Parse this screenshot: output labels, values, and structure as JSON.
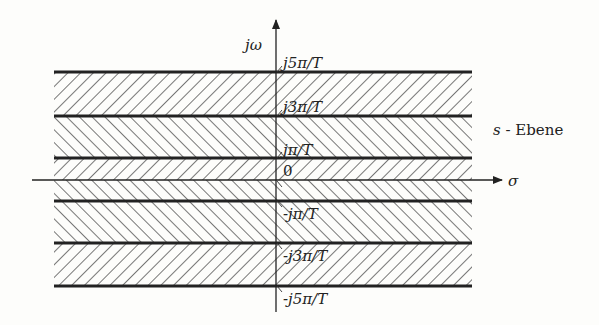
{
  "diagram": {
    "axes": {
      "vertical_label": "jω",
      "horizontal_label": "σ"
    },
    "plane_label": {
      "var": "s",
      "text": " - Ebene"
    },
    "tick_labels": [
      {
        "id": "p5",
        "text": "j5π/T"
      },
      {
        "id": "p3",
        "text": "j3π/T"
      },
      {
        "id": "p1",
        "text": "jπ/T"
      },
      {
        "id": "zero",
        "text": "0"
      },
      {
        "id": "m1",
        "text": "-jπ/T"
      },
      {
        "id": "m3",
        "text": "-j3π/T"
      },
      {
        "id": "m5",
        "text": "-j5π/T"
      }
    ],
    "strips": [
      {
        "from": "j5π/T",
        "to": "j3π/T",
        "hatch": "backslash"
      },
      {
        "from": "j3π/T",
        "to": "jπ/T",
        "hatch": "slash"
      },
      {
        "from": "jπ/T",
        "to": "-jπ/T",
        "hatch": "mixed (upper backslash, lower slash)"
      },
      {
        "from": "-jπ/T",
        "to": "-j3π/T",
        "hatch": "slash"
      },
      {
        "from": "-j3π/T",
        "to": "-j5π/T",
        "hatch": "backslash"
      }
    ],
    "colors": {
      "line": "#222222",
      "hatch": "#555555",
      "background": "#fdfdfb"
    }
  }
}
